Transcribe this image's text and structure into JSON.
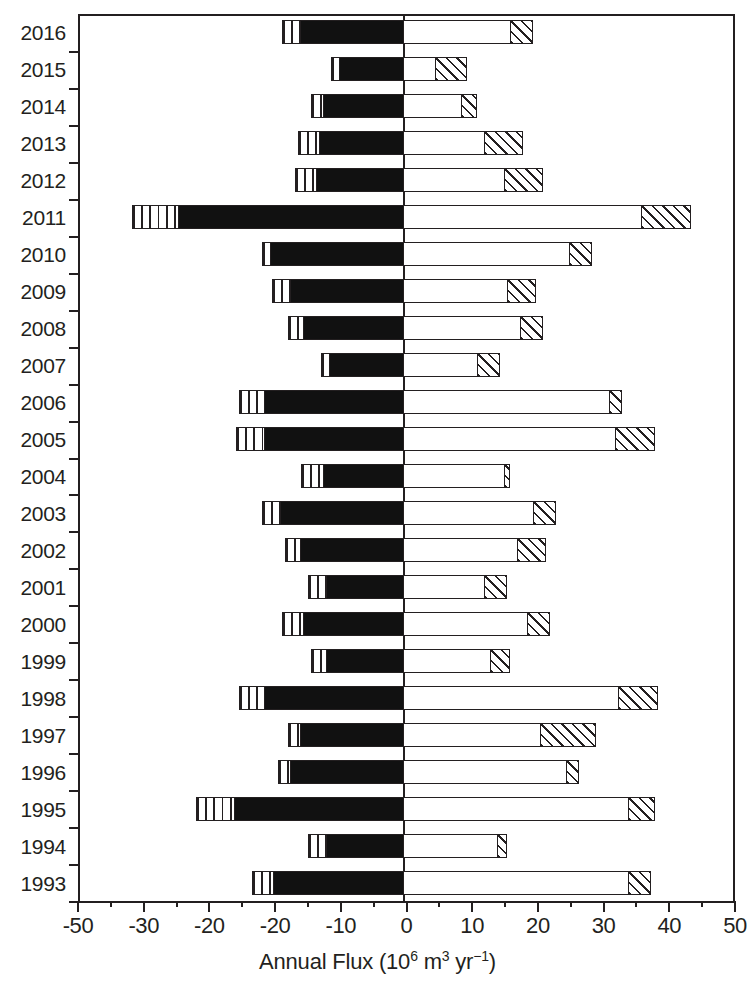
{
  "chart_data": {
    "type": "bar",
    "orientation": "horizontal",
    "title": "",
    "xlabel": "Annual Flux (10^6 m^3 yr^-1)",
    "ylabel": "",
    "xlim": [
      -50,
      50
    ],
    "grid": false,
    "legend": null,
    "stacked": true,
    "zero_reference_line": 0,
    "x_tick_labels": [
      "-50",
      "-30",
      "-20",
      "-20",
      "-10",
      "0",
      "10",
      "20",
      "30",
      "40",
      "50"
    ],
    "x_tick_values": [
      -50,
      -40,
      -30,
      -20,
      -10,
      0,
      10,
      20,
      30,
      40,
      50
    ],
    "x_minor_tick_step": 5,
    "categories": [
      "2016",
      "2015",
      "2014",
      "2013",
      "2012",
      "2011",
      "2010",
      "2009",
      "2008",
      "2007",
      "2006",
      "2005",
      "2004",
      "2003",
      "2002",
      "2001",
      "2000",
      "1999",
      "1998",
      "1997",
      "1996",
      "1995",
      "1994",
      "1993"
    ],
    "series": [
      {
        "name": "outer-negative-striped",
        "pattern": "vertical-stripes",
        "values": [
          -19.0,
          -11.5,
          -14.5,
          -16.5,
          -17.0,
          -41.8,
          -22.0,
          -20.5,
          -18.0,
          -13.0,
          -25.5,
          -26.0,
          -16.0,
          -22.0,
          -18.5,
          -15.0,
          -19.0,
          -14.5,
          -25.5,
          -18.0,
          -19.5,
          -32.0,
          -15.0,
          -23.5
        ]
      },
      {
        "name": "inner-negative-solid",
        "pattern": "solid-black",
        "values": [
          -16.0,
          -10.0,
          -12.5,
          -13.0,
          -13.5,
          -34.5,
          -20.5,
          -17.5,
          -15.5,
          -11.5,
          -21.5,
          -21.5,
          -12.5,
          -19.0,
          -16.0,
          -12.0,
          -15.5,
          -12.0,
          -21.5,
          -16.0,
          -17.5,
          -26.0,
          -12.0,
          -20.0
        ]
      },
      {
        "name": "inner-positive-open",
        "pattern": "white-open",
        "values": [
          16.5,
          5.0,
          9.0,
          12.5,
          15.5,
          36.5,
          25.5,
          16.0,
          18.0,
          11.5,
          31.5,
          32.5,
          15.5,
          20.0,
          17.5,
          12.5,
          19.0,
          13.5,
          33.0,
          21.0,
          25.0,
          34.5,
          14.5,
          34.5
        ]
      },
      {
        "name": "outer-positive-hatched",
        "pattern": "diagonal-hatch",
        "values": [
          20.0,
          10.0,
          11.5,
          18.5,
          21.5,
          44.0,
          29.0,
          20.5,
          21.5,
          15.0,
          33.5,
          38.5,
          16.5,
          23.5,
          22.0,
          16.0,
          22.5,
          16.5,
          39.0,
          29.5,
          27.0,
          38.5,
          16.0,
          38.0
        ]
      }
    ],
    "rows": [
      {
        "year": "2016",
        "striped_start": -19.0,
        "solid_start": -16.0,
        "open_end": 16.5,
        "hatch_end": 20.0
      },
      {
        "year": "2015",
        "striped_start": -11.5,
        "solid_start": -10.0,
        "open_end": 5.0,
        "hatch_end": 10.0
      },
      {
        "year": "2014",
        "striped_start": -14.5,
        "solid_start": -12.5,
        "open_end": 9.0,
        "hatch_end": 11.5
      },
      {
        "year": "2013",
        "striped_start": -16.5,
        "solid_start": -13.0,
        "open_end": 12.5,
        "hatch_end": 18.5
      },
      {
        "year": "2012",
        "striped_start": -17.0,
        "solid_start": -13.5,
        "open_end": 15.5,
        "hatch_end": 21.5
      },
      {
        "year": "2011",
        "striped_start": -41.8,
        "solid_start": -34.5,
        "open_end": 36.5,
        "hatch_end": 44.0
      },
      {
        "year": "2010",
        "striped_start": -22.0,
        "solid_start": -20.5,
        "open_end": 25.5,
        "hatch_end": 29.0
      },
      {
        "year": "2009",
        "striped_start": -20.5,
        "solid_start": -17.5,
        "open_end": 16.0,
        "hatch_end": 20.5
      },
      {
        "year": "2008",
        "striped_start": -18.0,
        "solid_start": -15.5,
        "open_end": 18.0,
        "hatch_end": 21.5
      },
      {
        "year": "2007",
        "striped_start": -13.0,
        "solid_start": -11.5,
        "open_end": 11.5,
        "hatch_end": 15.0
      },
      {
        "year": "2006",
        "striped_start": -25.5,
        "solid_start": -21.5,
        "open_end": 31.5,
        "hatch_end": 33.5
      },
      {
        "year": "2005",
        "striped_start": -26.0,
        "solid_start": -21.5,
        "open_end": 32.5,
        "hatch_end": 38.5
      },
      {
        "year": "2004",
        "striped_start": -16.0,
        "solid_start": -12.5,
        "open_end": 15.5,
        "hatch_end": 16.5
      },
      {
        "year": "2003",
        "striped_start": -22.0,
        "solid_start": -19.0,
        "open_end": 20.0,
        "hatch_end": 23.5
      },
      {
        "year": "2002",
        "striped_start": -18.5,
        "solid_start": -16.0,
        "open_end": 17.5,
        "hatch_end": 22.0
      },
      {
        "year": "2001",
        "striped_start": -15.0,
        "solid_start": -12.0,
        "open_end": 12.5,
        "hatch_end": 16.0
      },
      {
        "year": "2000",
        "striped_start": -19.0,
        "solid_start": -15.5,
        "open_end": 19.0,
        "hatch_end": 22.5
      },
      {
        "year": "1999",
        "striped_start": -14.5,
        "solid_start": -12.0,
        "open_end": 13.5,
        "hatch_end": 16.5
      },
      {
        "year": "1998",
        "striped_start": -25.5,
        "solid_start": -21.5,
        "open_end": 33.0,
        "hatch_end": 39.0
      },
      {
        "year": "1997",
        "striped_start": -18.0,
        "solid_start": -16.0,
        "open_end": 21.0,
        "hatch_end": 29.5
      },
      {
        "year": "1996",
        "striped_start": -19.5,
        "solid_start": -17.5,
        "open_end": 25.0,
        "hatch_end": 27.0
      },
      {
        "year": "1995",
        "striped_start": -32.0,
        "solid_start": -26.0,
        "open_end": 34.5,
        "hatch_end": 38.5
      },
      {
        "year": "1994",
        "striped_start": -15.0,
        "solid_start": -12.0,
        "open_end": 14.5,
        "hatch_end": 16.0
      },
      {
        "year": "1993",
        "striped_start": -23.5,
        "solid_start": -20.0,
        "open_end": 34.5,
        "hatch_end": 38.0
      }
    ]
  },
  "axis": {
    "x_title_main": "Annual Flux (10",
    "x_title_exp1": "6",
    "x_title_mid": " m",
    "x_title_exp2": "3",
    "x_title_unit": " yr",
    "x_title_exp3": "−1",
    "x_title_close": ")"
  },
  "colors": {
    "ink": "#231f20",
    "solid_fill": "#111111",
    "background": "#ffffff"
  }
}
